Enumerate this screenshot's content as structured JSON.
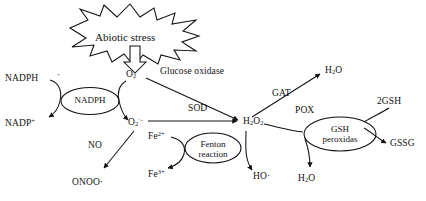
{
  "diagram": {
    "background_color": "#ffffff",
    "stroke_color": "#111111",
    "stressor": {
      "label": "Abiotic stress",
      "shape": "starburst"
    },
    "nodes": [
      {
        "id": "nadph-complex",
        "label_line1": "NADPH",
        "label_line2": "",
        "shape": "ellipse"
      },
      {
        "id": "fenton",
        "label_line1": "Fenton",
        "label_line2": "reaction",
        "shape": "ellipse"
      },
      {
        "id": "gsh-peroxidase",
        "label_line1": "GSH",
        "label_line2": "peroxidas",
        "shape": "ellipse"
      }
    ],
    "species": [
      {
        "id": "nadph",
        "text": "NADPH"
      },
      {
        "id": "nadp-plus",
        "text": "NADP+"
      },
      {
        "id": "o2",
        "text": "O2"
      },
      {
        "id": "superoxide",
        "text": "O2-"
      },
      {
        "id": "peroxynitrite",
        "text": "ONOO·"
      },
      {
        "id": "fe2",
        "text": "Fe2+"
      },
      {
        "id": "fe3",
        "text": "Fe3+"
      },
      {
        "id": "h2o2",
        "text": "H2O2"
      },
      {
        "id": "hydroxyl",
        "text": "HO·"
      },
      {
        "id": "water-top",
        "text": "H2O"
      },
      {
        "id": "water-bottom",
        "text": "H2O"
      },
      {
        "id": "gsh",
        "text": "2GSH"
      },
      {
        "id": "gssg",
        "text": "GSSG"
      }
    ],
    "enzymes": [
      {
        "id": "glucose-oxidase",
        "text": "Glucose oxidase"
      },
      {
        "id": "sod",
        "text": "SOD"
      },
      {
        "id": "gat",
        "text": "GAT"
      },
      {
        "id": "pox",
        "text": "POX"
      },
      {
        "id": "no",
        "text": "NO"
      }
    ]
  },
  "labels": {
    "abiotic_stress": "Abiotic stress",
    "nadph_left": "NADPH",
    "nadph_dot": "·",
    "nadp_plus": "NADP",
    "nadp_plus_sup": "+",
    "nadph_node": "NADPH",
    "o2": "O",
    "o2_sub": "2",
    "superoxide": "O",
    "superoxide_sub": "2",
    "superoxide_sup": "·-",
    "glucose_oxidase": "Glucose oxidase",
    "sod": "SOD",
    "no": "NO",
    "onoo": "ONOO·",
    "fe2": "Fe",
    "fe2_sup": "2+",
    "fe3": "Fe",
    "fe3_sup": "3+",
    "fenton_line1": "Fenton",
    "fenton_line2": "reaction",
    "h2o2": "H",
    "h2o2_sub1": "2",
    "h2o2_o": "O",
    "h2o2_sub2": "2",
    "gat": "GAT",
    "pox": "POX",
    "h2o_top": "H",
    "h2o_top_sub": "2",
    "h2o_top_o": "O",
    "h2o_bottom": "H",
    "h2o_bottom_sub": "2",
    "h2o_bottom_o": "O",
    "gsh": "2GSH",
    "gssg": "GSSG",
    "gsh_node_line1": "GSH",
    "gsh_node_line2": "peroxidas",
    "ho_radical": "HO·"
  }
}
